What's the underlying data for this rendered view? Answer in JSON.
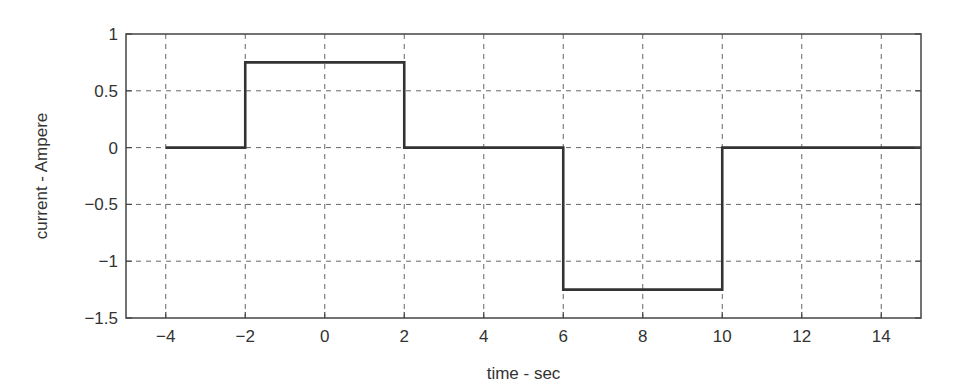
{
  "chart_data": {
    "type": "line",
    "title": "",
    "xlabel": "time - sec",
    "ylabel": "current - Ampere",
    "xlim": [
      -5,
      15
    ],
    "ylim": [
      -1.5,
      1
    ],
    "grid": true,
    "legend": null,
    "xticks": [
      -4,
      -2,
      0,
      2,
      4,
      6,
      8,
      10,
      12,
      14
    ],
    "xtick_labels": [
      "−4",
      "−2",
      "0",
      "2",
      "4",
      "6",
      "8",
      "10",
      "12",
      "14"
    ],
    "yticks": [
      1,
      0.5,
      0,
      -0.5,
      -1,
      -1.5
    ],
    "ytick_labels": [
      "1",
      "0.5",
      "0",
      "−0.5",
      "−1",
      "−1.5"
    ],
    "series": [
      {
        "name": "current",
        "style": "step",
        "color": "#333333",
        "x": [
          -4,
          -2,
          -2,
          2,
          2,
          6,
          6,
          10,
          10,
          15
        ],
        "y": [
          0,
          0,
          0.75,
          0.75,
          0,
          0,
          -1.25,
          -1.25,
          0,
          0
        ]
      }
    ]
  },
  "colors": {
    "axes": "#444444",
    "grid": "#666666",
    "line": "#333333",
    "text": "#333333"
  }
}
